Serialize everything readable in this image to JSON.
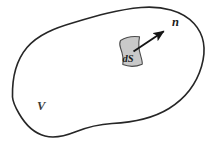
{
  "figure": {
    "background_color": "#ffffff",
    "outline_color": "#262626",
    "outline_width": 1.6,
    "patch_fill_color": "#c9c9c9",
    "patch_stroke_color": "#4a4a4a",
    "arrow_color": "#151515"
  },
  "labels": {
    "volume": "V",
    "surface_element": "dS",
    "normal": "n"
  },
  "geometry": {
    "volume_outline_path": "M 12.5 97 C 12.0 78 16.5 60 27.0 47.5 C 38.0 34.5 55.0 28.0 74.0 22.5 C 96.0 16.0 118.0 9.5 141.0 7.5 C 162.0 5.8 182.0 10.5 194.0 23.5 C 204.5 35.0 206.0 51.0 201.5 66.5 C 196.5 83.5 185.0 98.5 169.0 108.5 C 152.0 119.0 131.0 122.5 112.0 123.5 C 97.0 124.3 85.0 128.0 75.0 132.0 C 65.0 136.0 55.0 138.5 45.0 136.0 C 33.5 133.0 25.0 124.0 19.0 113.5 C 15.2 107.0 12.8 102.0 12.5 97 Z",
    "surface_patch_path": "M 120.5 40.5 C 126.0 37.0 132.5 35.8 139.5 36.8 C 138.2 43.5 138.8 50.0 140.8 56.2 C 141.8 59.5 142.6 62.0 142.2 64.2 C 136.0 66.8 129.0 67.0 122.8 64.6 C 123.6 59.0 122.6 53.4 120.6 48.2 C 119.6 45.5 119.4 42.8 120.5 40.5 Z",
    "normal_arrow": {
      "x1": 133.5,
      "y1": 51.5,
      "x2": 166.5,
      "y2": 29.5
    },
    "label_positions": {
      "volume": {
        "x": 37,
        "y": 110
      },
      "surface_element": {
        "x": 122.5,
        "y": 61.5
      },
      "normal": {
        "x": 172,
        "y": 26
      }
    }
  },
  "chart_data": {
    "type": "diagram",
    "elements": [
      {
        "name": "volume-boundary",
        "kind": "closed-curve",
        "label": "V",
        "fill": "#ffffff",
        "stroke": "#262626"
      },
      {
        "name": "surface-element",
        "kind": "quadrilateral-patch",
        "label": "dS",
        "fill": "#c9c9c9",
        "stroke": "#4a4a4a"
      },
      {
        "name": "outward-normal",
        "kind": "vector-arrow",
        "label": "n",
        "stroke": "#151515",
        "direction_degrees": 33.7
      }
    ]
  }
}
